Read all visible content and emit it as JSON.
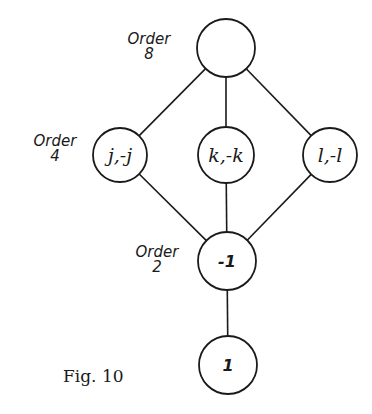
{
  "figure": {
    "caption": "Fig. 10",
    "type": "subgroup lattice diagram"
  },
  "nodes": [
    {
      "id": "top",
      "label": "",
      "cx": 226,
      "cy": 48,
      "r": 29
    },
    {
      "id": "j",
      "label": "j,-j",
      "cx": 120,
      "cy": 155,
      "r": 27
    },
    {
      "id": "k",
      "label": "k,-k",
      "cx": 226,
      "cy": 155,
      "r": 28
    },
    {
      "id": "l",
      "label": "l,-l",
      "cx": 330,
      "cy": 155,
      "r": 27
    },
    {
      "id": "neg1",
      "label": "-1",
      "cx": 227,
      "cy": 261,
      "r": 29
    },
    {
      "id": "one",
      "label": "1",
      "cx": 228,
      "cy": 365,
      "r": 29
    }
  ],
  "edges": [
    {
      "from": "top",
      "to": "j"
    },
    {
      "from": "top",
      "to": "k"
    },
    {
      "from": "top",
      "to": "l"
    },
    {
      "from": "j",
      "to": "neg1"
    },
    {
      "from": "k",
      "to": "neg1"
    },
    {
      "from": "l",
      "to": "neg1"
    },
    {
      "from": "neg1",
      "to": "one"
    }
  ],
  "order_labels": [
    {
      "text": "Order",
      "value": "8",
      "x": 149,
      "y": 44
    },
    {
      "text": "Order",
      "value": "4",
      "x": 55,
      "y": 146
    },
    {
      "text": "Order",
      "value": "2",
      "x": 157,
      "y": 257
    }
  ]
}
